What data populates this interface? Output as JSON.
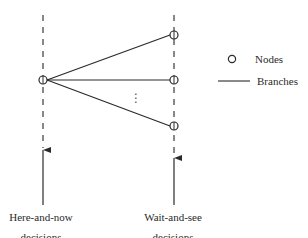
{
  "diagram": {
    "title": "",
    "stages": [
      {
        "id": "here-and-now",
        "line1": "Here-and-now",
        "line2": "decisions"
      },
      {
        "id": "wait-and-see",
        "line1": "Wait-and-see",
        "line2": "decisions"
      }
    ],
    "nodes": [
      {
        "id": "root",
        "stage": "here-and-now"
      },
      {
        "id": "scenario-1",
        "stage": "wait-and-see"
      },
      {
        "id": "scenario-2",
        "stage": "wait-and-see"
      },
      {
        "id": "scenario-n",
        "stage": "wait-and-see"
      }
    ],
    "branches": [
      {
        "from": "root",
        "to": "scenario-1"
      },
      {
        "from": "root",
        "to": "scenario-2"
      },
      {
        "from": "root",
        "to": "scenario-n"
      }
    ],
    "ellipsis": "⋮",
    "legend": {
      "items": [
        {
          "symbol": "node-circle",
          "label": "Nodes"
        },
        {
          "symbol": "branch-line",
          "label": "Branches"
        }
      ]
    },
    "colors": {
      "stroke": "#2a2a2a",
      "dash": "#3a3a3a",
      "background": "#ffffff"
    }
  }
}
